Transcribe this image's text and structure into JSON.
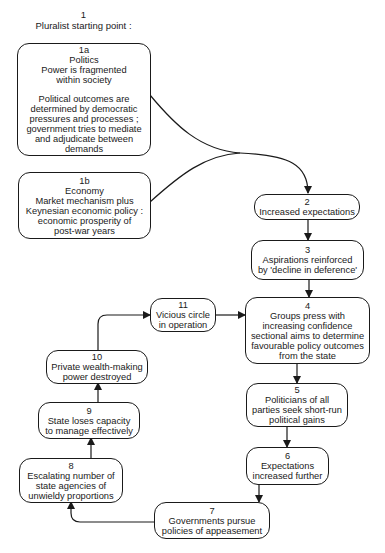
{
  "heading": {
    "number": "1",
    "title": "Pluralist starting point :"
  },
  "nodes": {
    "n1a": {
      "number": "1a",
      "lines": [
        "Politics",
        "Power is fragmented",
        "within society",
        "",
        "Political outcomes are",
        "determined by democratic",
        "pressures and processes ;",
        "government tries to mediate",
        "and adjudicate between",
        "demands"
      ]
    },
    "n1b": {
      "number": "1b",
      "lines": [
        "Economy",
        "Market mechanism plus",
        "Keynesian economic policy :",
        "economic prosperity of",
        "post-war years"
      ]
    },
    "n2": {
      "number": "2",
      "lines": [
        "Increased expectations"
      ]
    },
    "n3": {
      "number": "3",
      "lines": [
        "Aspirations reinforced",
        "by 'decline in deference'"
      ]
    },
    "n4": {
      "number": "4",
      "lines": [
        "Groups press with",
        "increasing confidence",
        "sectional aims to determine",
        "favourable policy outcomes",
        "from the state"
      ]
    },
    "n5": {
      "number": "5",
      "lines": [
        "Politicians of all",
        "parties seek short-run",
        "political gains"
      ]
    },
    "n6": {
      "number": "6",
      "lines": [
        "Expectations",
        "increased further"
      ]
    },
    "n7": {
      "number": "7",
      "lines": [
        "Governments pursue",
        "policies of appeasement"
      ]
    },
    "n8": {
      "number": "8",
      "lines": [
        "Escalating number of",
        "state agencies of",
        "unwieldy proportions"
      ]
    },
    "n9": {
      "number": "9",
      "lines": [
        "State loses capacity",
        "to manage effectively"
      ]
    },
    "n10": {
      "number": "10",
      "lines": [
        "Private wealth-making",
        "power destroyed"
      ]
    },
    "n11": {
      "number": "11",
      "lines": [
        "Vicious circle",
        "in operation"
      ]
    }
  },
  "edges": [
    {
      "from": "1a",
      "to": "2"
    },
    {
      "from": "1b",
      "to": "2"
    },
    {
      "from": "2",
      "to": "3"
    },
    {
      "from": "3",
      "to": "4"
    },
    {
      "from": "4",
      "to": "5"
    },
    {
      "from": "5",
      "to": "6"
    },
    {
      "from": "6",
      "to": "7"
    },
    {
      "from": "7",
      "to": "8"
    },
    {
      "from": "8",
      "to": "9"
    },
    {
      "from": "9",
      "to": "10"
    },
    {
      "from": "10",
      "to": "11"
    },
    {
      "from": "11",
      "to": "4"
    }
  ],
  "colors": {
    "stroke": "#1a1a1a",
    "background": "#ffffff"
  }
}
